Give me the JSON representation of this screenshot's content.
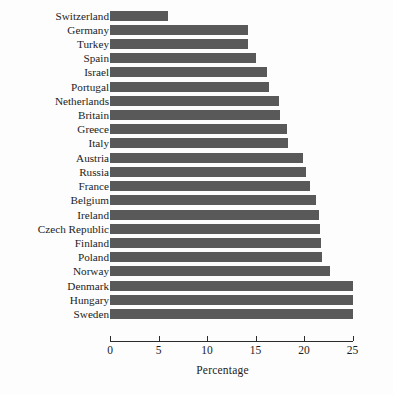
{
  "figure": {
    "top_clipped_caption": "",
    "background_color": "#fdfdfd",
    "bar_color": "#595959",
    "axis_color": "#2b2b2b",
    "text_color": "#1c1c1c"
  },
  "axis": {
    "x_title": "Percentage",
    "ticks": [
      "0",
      "5",
      "10",
      "15",
      "20",
      "25"
    ]
  },
  "chart_data": {
    "type": "bar",
    "orientation": "horizontal",
    "title": "",
    "xlabel": "Percentage",
    "ylabel": "",
    "xlim": [
      0,
      25
    ],
    "xticks": [
      0,
      5,
      10,
      15,
      20,
      25
    ],
    "grid": false,
    "legend": null,
    "bar_color": "#595959",
    "categories": [
      "Switzerland",
      "Germany",
      "Turkey",
      "Spain",
      "Israel",
      "Portugal",
      "Netherlands",
      "Britain",
      "Greece",
      "Italy",
      "Austria",
      "Russia",
      "France",
      "Belgium",
      "Ireland",
      "Czech Republic",
      "Finland",
      "Poland",
      "Norway",
      "Denmark",
      "Hungary",
      "Sweden"
    ],
    "values": [
      6.0,
      14.2,
      14.2,
      15.0,
      16.2,
      16.4,
      17.4,
      17.5,
      18.2,
      18.3,
      19.9,
      20.2,
      20.6,
      21.2,
      21.5,
      21.6,
      21.8,
      21.9,
      22.7,
      25.0,
      25.0,
      25.0
    ]
  }
}
